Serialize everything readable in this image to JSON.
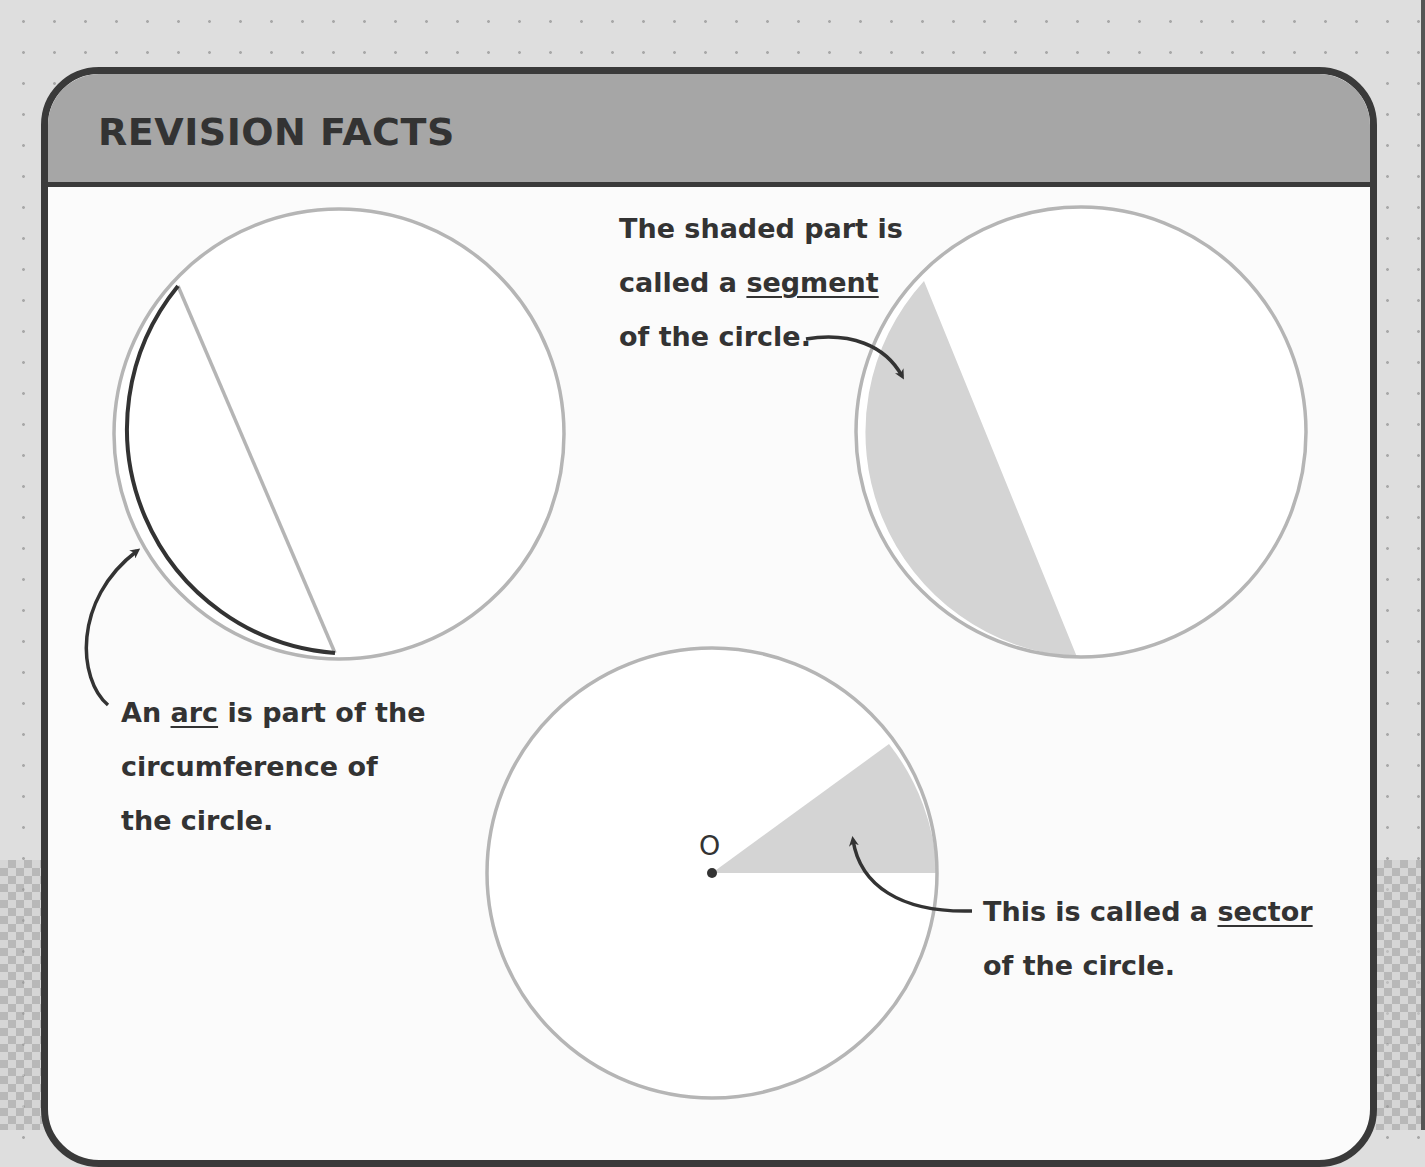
{
  "header": {
    "title": "REVISION FACTS"
  },
  "arc_fact": {
    "pre": "An ",
    "term": "arc",
    "line1_post": " is part of the",
    "line2": "circumference of",
    "line3": "the circle."
  },
  "segment_fact": {
    "line1": "The shaded part is",
    "line2_pre": "called a ",
    "term": "segment",
    "line3": "of the circle."
  },
  "sector_fact": {
    "line1_pre": "This is called a ",
    "term": "sector",
    "line2": "of the circle.",
    "center_label": "O"
  },
  "colors": {
    "header_bg": "#a6a6a6",
    "border": "#3a3a3a",
    "circle_stroke": "#b5b5b5",
    "shade": "#d4d4d4",
    "text": "#333333"
  }
}
